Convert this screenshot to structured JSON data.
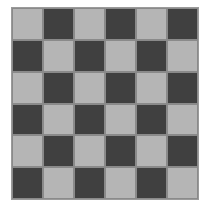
{
  "board": {
    "rows": 6,
    "cols": 6,
    "top_left": "light",
    "colors": {
      "light": "#b5b5b5",
      "dark": "#404040"
    }
  }
}
